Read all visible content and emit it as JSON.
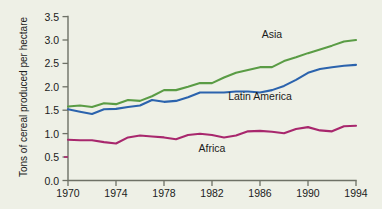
{
  "chart_data": {
    "type": "line",
    "title": "",
    "xlabel": "",
    "ylabel": "Tons of cereal produced per hectare",
    "xlim": [
      1970,
      1994
    ],
    "ylim": [
      0.0,
      3.5
    ],
    "grid": false,
    "legend_position": "inline-labels",
    "x_ticks": [
      "1970",
      "1974",
      "1978",
      "1982",
      "1986",
      "1990",
      "1994"
    ],
    "y_ticks": [
      "0.0",
      "0.5",
      "1.0",
      "1.5",
      "2.0",
      "2.5",
      "3.0",
      "3.5"
    ],
    "x": [
      1970,
      1971,
      1972,
      1973,
      1974,
      1975,
      1976,
      1977,
      1978,
      1979,
      1980,
      1981,
      1982,
      1983,
      1984,
      1985,
      1986,
      1987,
      1988,
      1989,
      1990,
      1991,
      1992,
      1993,
      1994
    ],
    "series": [
      {
        "name": "Asia",
        "color": "#5a9c45",
        "label_x": 1987,
        "label_y": 3.05,
        "values": [
          1.58,
          1.6,
          1.57,
          1.65,
          1.63,
          1.72,
          1.7,
          1.8,
          1.93,
          1.93,
          2.0,
          2.08,
          2.08,
          2.2,
          2.3,
          2.36,
          2.42,
          2.42,
          2.55,
          2.63,
          2.72,
          2.8,
          2.88,
          2.97,
          3.0
        ]
      },
      {
        "name": "Latin America",
        "color": "#2b63ad",
        "label_x": 1986,
        "label_y": 1.72,
        "values": [
          1.52,
          1.47,
          1.42,
          1.52,
          1.53,
          1.57,
          1.6,
          1.72,
          1.68,
          1.7,
          1.78,
          1.88,
          1.88,
          1.88,
          1.9,
          1.9,
          1.88,
          1.93,
          2.02,
          2.15,
          2.3,
          2.38,
          2.42,
          2.45,
          2.47
        ]
      },
      {
        "name": "Africa",
        "color": "#a8276d",
        "label_x": 1982,
        "label_y": 0.62,
        "values": [
          0.87,
          0.86,
          0.86,
          0.82,
          0.79,
          0.92,
          0.96,
          0.94,
          0.92,
          0.88,
          0.97,
          1.0,
          0.97,
          0.92,
          0.96,
          1.05,
          1.06,
          1.04,
          1.01,
          1.1,
          1.14,
          1.07,
          1.05,
          1.16,
          1.17
        ]
      }
    ]
  },
  "axis": {
    "y_title": "Tons of cereal produced per hectare"
  },
  "labels": {
    "asia": "Asia",
    "latin_america": "Latin America",
    "africa": "Africa"
  },
  "y_ticks": {
    "t0": "0.0",
    "t1": "0.5",
    "t2": "1.0",
    "t3": "1.5",
    "t4": "2.0",
    "t5": "2.5",
    "t6": "3.0",
    "t7": "3.5"
  },
  "x_ticks": {
    "t0": "1970",
    "t1": "1974",
    "t2": "1978",
    "t3": "1982",
    "t4": "1986",
    "t5": "1990",
    "t6": "1994"
  },
  "colors": {
    "asia": "#5a9c45",
    "latin_america": "#2b63ad",
    "africa": "#a8276d",
    "axis": "#6e7166",
    "background": "#eef0e6"
  }
}
